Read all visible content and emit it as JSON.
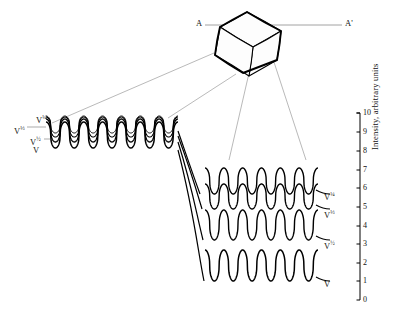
{
  "figure": {
    "kind": "scientific-diagram",
    "background": "#ffffff",
    "ink_color": "#000000",
    "guide_color": "#8a8a8a"
  },
  "section_line": {
    "label_left": "A",
    "label_right": "A'",
    "y": 25,
    "x_start": 205,
    "x_end": 342
  },
  "crystal": {
    "name": "crystal-block",
    "outline_points": "247,12 281,31 277,60 243,73 215,55 220,27",
    "faces": [
      "220,27 247,12 281,31 253,47",
      "253,47 281,31 277,60 249,76",
      "220,27 253,47 249,76 215,55"
    ]
  },
  "axis": {
    "title": "Intensity,  arbitrary units",
    "x": 360,
    "y_top": 113,
    "y_bottom": 300,
    "ticks": [
      {
        "value": "10",
        "y": 113
      },
      {
        "value": "9",
        "y": 132
      },
      {
        "value": "8",
        "y": 151
      },
      {
        "value": "7",
        "y": 170
      },
      {
        "value": "6",
        "y": 188
      },
      {
        "value": "5",
        "y": 207
      },
      {
        "value": "4",
        "y": 226
      },
      {
        "value": "3",
        "y": 244
      },
      {
        "value": "2",
        "y": 263
      },
      {
        "value": "1",
        "y": 281
      },
      {
        "value": "0",
        "y": 300
      }
    ]
  },
  "left_trace_group": {
    "name": "left-waveform-group",
    "x_start": 46,
    "x_end": 178,
    "periods": 7,
    "traces": [
      {
        "label": "V",
        "power": "1",
        "baseline": 148,
        "amplitude": 26,
        "lw": 1.5
      },
      {
        "label": "V",
        "power": "1/2",
        "baseline": 142,
        "amplitude": 23,
        "lw": 1.3
      },
      {
        "label": "V",
        "power": "1/3",
        "baseline": 137,
        "amplitude": 20,
        "lw": 1.1
      },
      {
        "label": "V",
        "power": "1/4",
        "baseline": 133,
        "amplitude": 17,
        "lw": 1.0
      }
    ],
    "labels": [
      {
        "text": "V",
        "sup": "¼",
        "x": 36,
        "y": 113
      },
      {
        "text": "V",
        "sup": "⅓",
        "x": 14,
        "y": 124
      },
      {
        "text": "V",
        "sup": "½",
        "x": 30,
        "y": 135
      },
      {
        "text": "V",
        "sup": "",
        "x": 33,
        "y": 146
      }
    ]
  },
  "right_trace_group": {
    "name": "right-waveform-group",
    "x_start": 205,
    "x_end": 318,
    "periods": 6,
    "traces": [
      {
        "label": "V",
        "power": "1/4",
        "baseline": 194,
        "amplitude": 26,
        "lw": 1.4
      },
      {
        "label": "V",
        "power": "1/3",
        "baseline": 209,
        "amplitude": 25,
        "lw": 1.4
      },
      {
        "label": "V",
        "power": "1/2",
        "baseline": 240,
        "amplitude": 30,
        "lw": 1.4
      },
      {
        "label": "V",
        "power": "1",
        "baseline": 281,
        "amplitude": 31,
        "lw": 1.5
      }
    ],
    "labels": [
      {
        "text": "V",
        "sup": "¼",
        "x": 324,
        "y": 190
      },
      {
        "text": "V",
        "sup": "⅓",
        "x": 324,
        "y": 208
      },
      {
        "text": "V",
        "sup": "½",
        "x": 324,
        "y": 239
      },
      {
        "text": "V",
        "sup": "",
        "x": 324,
        "y": 280
      }
    ]
  },
  "connectors": {
    "name": "fan-connector-curves",
    "paths": [
      "M178,131 C188,160 192,172 200,194",
      "M178,136 C190,168 194,182 202,209",
      "M178,142 C192,186 196,212 203,240",
      "M178,150 C194,212 198,252 204,281"
    ]
  },
  "guides": {
    "name": "projection-guide-lines",
    "paths": [
      "M214,53 L52,123",
      "M236,74 L168,118",
      "M252,60 L229,160",
      "M272,56 L306,160"
    ]
  },
  "chart_data": {
    "type": "line",
    "title": "",
    "xlabel": "",
    "ylabel": "Intensity,  arbitrary units",
    "ylim": [
      0,
      10
    ],
    "yticks": [
      0,
      1,
      2,
      3,
      4,
      5,
      6,
      7,
      8,
      9,
      10
    ],
    "grid": false,
    "legend": "inline-right-labels",
    "annotations": [
      "A",
      "A'"
    ],
    "panels": [
      {
        "name": "left-panel",
        "description": "High-frequency nested oscillations, 7 periods, four superposed traces",
        "series": [
          {
            "name": "V",
            "periods": 7,
            "baseline_units": 8.0,
            "amplitude_units": 1.4
          },
          {
            "name": "V^(1/2)",
            "periods": 7,
            "baseline_units": 8.3,
            "amplitude_units": 1.2
          },
          {
            "name": "V^(1/3)",
            "periods": 7,
            "baseline_units": 8.6,
            "amplitude_units": 1.05
          },
          {
            "name": "V^(1/4)",
            "periods": 7,
            "baseline_units": 8.8,
            "amplitude_units": 0.9
          }
        ]
      },
      {
        "name": "right-panel",
        "description": "Expanded oscillations, 6 periods, four stacked traces",
        "series": [
          {
            "name": "V^(1/4)",
            "periods": 6,
            "baseline_units": 5.7,
            "amplitude_units": 1.4
          },
          {
            "name": "V^(1/3)",
            "periods": 6,
            "baseline_units": 4.9,
            "amplitude_units": 1.3
          },
          {
            "name": "V^(1/2)",
            "periods": 6,
            "baseline_units": 3.2,
            "amplitude_units": 1.6
          },
          {
            "name": "V",
            "periods": 6,
            "baseline_units": 1.0,
            "amplitude_units": 1.65
          }
        ]
      }
    ]
  }
}
